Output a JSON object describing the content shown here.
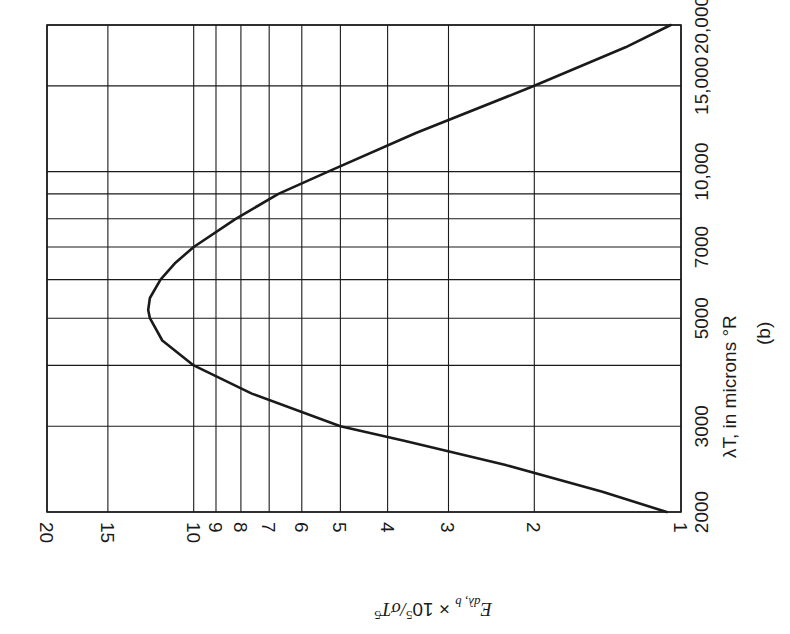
{
  "chart_data": {
    "type": "line",
    "title": "",
    "subtitle": "(b)",
    "orientation": "rotated 90° (page printed sideways)",
    "xlabel": "λT, in microns °R",
    "ylabel": "E_dλ,b × 10^5 / σT^5",
    "xscale": "log",
    "yscale": "log",
    "xlim": [
      2000,
      20000
    ],
    "ylim": [
      1,
      20
    ],
    "x_ticks": [
      "2000",
      "3000",
      "5000",
      "7000",
      "10,000",
      "15,000",
      "20,000"
    ],
    "x_gridlines": [
      2000,
      3000,
      4000,
      5000,
      6000,
      7000,
      8000,
      9000,
      10000,
      15000,
      20000
    ],
    "y_ticks": [
      "1",
      "2",
      "3",
      "4",
      "5",
      "6",
      "7",
      "8",
      "9",
      "10",
      "15",
      "20"
    ],
    "y_gridlines": [
      1,
      2,
      3,
      4,
      5,
      6,
      7,
      8,
      9,
      10,
      15,
      20
    ],
    "grid": true,
    "legend": null,
    "series": [
      {
        "name": "Blackbody spectral emissive power",
        "x": [
          2000,
          2200,
          2500,
          2800,
          3000,
          3500,
          4000,
          4500,
          5000,
          5200,
          5500,
          6000,
          6500,
          7000,
          8000,
          9000,
          10000,
          12000,
          15000,
          18000,
          20000
        ],
        "values": [
          1.07,
          1.45,
          2.3,
          3.7,
          5.0,
          7.6,
          10.0,
          11.6,
          12.3,
          12.4,
          12.3,
          11.7,
          10.9,
          10.0,
          8.2,
          6.7,
          5.3,
          3.5,
          2.0,
          1.3,
          1.05
        ]
      }
    ]
  },
  "labels": {
    "x_axis_title": "λT, in microns °R",
    "panel": "(b)",
    "y_axis_title_main": "E",
    "y_axis_title_sub": "dλ, b",
    "y_axis_title_rest": " × 10",
    "y_axis_title_exp1": "5",
    "y_axis_title_tail": "/σT",
    "y_axis_title_exp2": "5"
  },
  "colors": {
    "ink": "#1a1a1a",
    "background": "#ffffff"
  }
}
